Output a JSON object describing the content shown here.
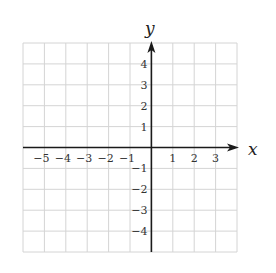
{
  "chart_data": {
    "type": "scatter",
    "title": "",
    "xlabel": "x",
    "ylabel": "y",
    "xlim": [
      -6,
      4
    ],
    "ylim": [
      -5,
      5
    ],
    "grid": true,
    "x_ticks": [
      -5,
      -4,
      -3,
      -2,
      -1,
      1,
      2,
      3
    ],
    "y_ticks": [
      -4,
      -3,
      -2,
      -1,
      1,
      2,
      3,
      4
    ],
    "x_tick_labels": [
      "−5",
      "−4",
      "−3",
      "−2",
      "−1",
      "1",
      "2",
      "3"
    ],
    "y_tick_labels": [
      "−4",
      "−3",
      "−2",
      "−1",
      "1",
      "2",
      "3",
      "4"
    ],
    "series": [],
    "legend": null,
    "arrows": {
      "x_positive": true,
      "y_positive": true
    }
  },
  "axes": {
    "x_title": "x",
    "y_title": "y"
  },
  "colors": {
    "grid": "#d4d4d4",
    "axis": "#1a1a1a",
    "text": "#333333"
  }
}
